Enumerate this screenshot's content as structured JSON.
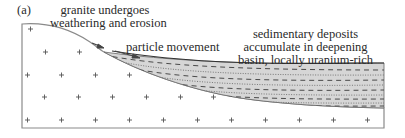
{
  "figure": {
    "panel_label": "(a)",
    "labels": {
      "granite": [
        "granite undergoes",
        "weathering and erosion"
      ],
      "particle": "particle movement",
      "sediment": [
        "sedimentary deposits",
        "accumulate in deepening",
        "basin, locally uranium-rich"
      ]
    },
    "symbols": {
      "granite_marker": "+",
      "sediment_pattern": "dashed-and-dotted layers"
    },
    "colors": {
      "outline": "#888888",
      "sediment_fill": "#d4d4d4",
      "sediment_dash": "#555555",
      "text": "#2a2a2a"
    }
  }
}
